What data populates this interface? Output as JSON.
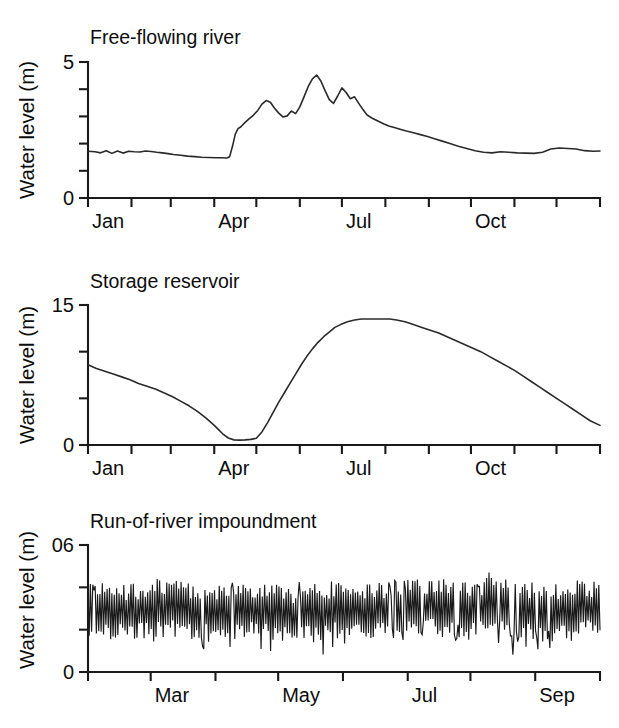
{
  "figure": {
    "axis_title": "Water level (m)",
    "line_color": "#2a2a2a",
    "axis_color": "#1a1a1a",
    "background": "#ffffff"
  },
  "panels": [
    {
      "id": "free-flowing-river",
      "title": "Free-flowing river",
      "ylabel": "Water level (m)",
      "y_top_label": "5",
      "y_bottom_label": "0",
      "x_labels": [
        "Jan",
        "Apr",
        "Jul",
        "Oct"
      ]
    },
    {
      "id": "storage-reservoir",
      "title": "Storage reservoir",
      "ylabel": "Water level (m)",
      "y_top_label": "15",
      "y_bottom_label": "0",
      "x_labels": [
        "Jan",
        "Apr",
        "Jul",
        "Oct"
      ]
    },
    {
      "id": "run-of-river-impoundment",
      "title": "Run-of-river impoundment",
      "ylabel": "Water level (m)",
      "y_top_label": "06",
      "y_bottom_label": "0",
      "x_labels": [
        "Mar",
        "May",
        "Jul",
        "Sep"
      ]
    }
  ],
  "chart_data": [
    {
      "type": "line",
      "title": "Free-flowing river",
      "xlabel": "",
      "ylabel": "Water level (m)",
      "ylim": [
        0,
        5
      ],
      "yticks": [
        0,
        1,
        2,
        3,
        4,
        5
      ],
      "ytick_labels": [
        "0",
        "",
        "",
        "",
        "",
        "5"
      ],
      "grid": false,
      "legend": "none",
      "xlim": [
        0,
        365
      ],
      "xtick_days": [
        0,
        31,
        59,
        90,
        120,
        151,
        181,
        212,
        243,
        273,
        304,
        334,
        365
      ],
      "xtick_labels": [
        "Jan",
        "",
        "",
        "Apr",
        "",
        "",
        "Jul",
        "",
        "",
        "Oct",
        "",
        "",
        ""
      ],
      "x": [
        0,
        5,
        9,
        13,
        17,
        21,
        25,
        29,
        33,
        37,
        41,
        45,
        49,
        53,
        57,
        61,
        66,
        71,
        76,
        81,
        86,
        91,
        95,
        99,
        101,
        103,
        105,
        107,
        109,
        112,
        115,
        118,
        121,
        124,
        127,
        130,
        133,
        136,
        139,
        142,
        145,
        148,
        151,
        154,
        157,
        160,
        163,
        166,
        169,
        172,
        175,
        178,
        181,
        184,
        187,
        190,
        193,
        196,
        199,
        203,
        207,
        211,
        215,
        219,
        223,
        227,
        232,
        237,
        242,
        247,
        252,
        258,
        264,
        270,
        276,
        282,
        288,
        294,
        300,
        306,
        312,
        318,
        324,
        330,
        336,
        342,
        348,
        354,
        360,
        365
      ],
      "y": [
        1.72,
        1.7,
        1.66,
        1.74,
        1.64,
        1.73,
        1.65,
        1.72,
        1.7,
        1.69,
        1.73,
        1.71,
        1.68,
        1.66,
        1.63,
        1.6,
        1.57,
        1.54,
        1.52,
        1.5,
        1.49,
        1.48,
        1.48,
        1.47,
        1.52,
        1.9,
        2.35,
        2.55,
        2.62,
        2.78,
        2.92,
        3.05,
        3.22,
        3.45,
        3.58,
        3.52,
        3.3,
        3.12,
        2.98,
        3.02,
        3.2,
        3.1,
        3.35,
        3.72,
        4.1,
        4.38,
        4.52,
        4.3,
        3.95,
        3.62,
        3.48,
        3.75,
        4.05,
        3.88,
        3.65,
        3.72,
        3.48,
        3.25,
        3.05,
        2.92,
        2.82,
        2.72,
        2.64,
        2.58,
        2.52,
        2.46,
        2.4,
        2.33,
        2.26,
        2.18,
        2.1,
        2.0,
        1.9,
        1.82,
        1.74,
        1.68,
        1.66,
        1.7,
        1.68,
        1.66,
        1.65,
        1.64,
        1.68,
        1.8,
        1.84,
        1.82,
        1.8,
        1.74,
        1.72,
        1.73
      ]
    },
    {
      "type": "line",
      "title": "Storage reservoir",
      "xlabel": "",
      "ylabel": "Water level (m)",
      "ylim": [
        0,
        15
      ],
      "yticks": [
        0,
        5,
        10,
        15
      ],
      "ytick_labels": [
        "0",
        "",
        "",
        "15"
      ],
      "grid": false,
      "legend": "none",
      "xlim": [
        0,
        365
      ],
      "xtick_days": [
        0,
        31,
        59,
        90,
        120,
        151,
        181,
        212,
        243,
        273,
        304,
        334,
        365
      ],
      "xtick_labels": [
        "Jan",
        "",
        "",
        "Apr",
        "",
        "",
        "Jul",
        "",
        "",
        "Oct",
        "",
        "",
        ""
      ],
      "x": [
        0,
        6,
        12,
        18,
        24,
        30,
        36,
        42,
        48,
        54,
        60,
        66,
        72,
        78,
        84,
        90,
        96,
        100,
        104,
        108,
        112,
        116,
        120,
        124,
        128,
        132,
        136,
        140,
        144,
        148,
        152,
        156,
        160,
        164,
        168,
        172,
        176,
        180,
        185,
        190,
        195,
        200,
        205,
        210,
        215,
        220,
        226,
        232,
        238,
        244,
        250,
        256,
        262,
        268,
        274,
        280,
        286,
        292,
        298,
        304,
        310,
        316,
        322,
        328,
        334,
        340,
        346,
        352,
        358,
        365
      ],
      "y": [
        8.6,
        8.2,
        7.9,
        7.6,
        7.3,
        7.0,
        6.6,
        6.3,
        6.0,
        5.6,
        5.2,
        4.7,
        4.2,
        3.6,
        2.9,
        2.1,
        1.2,
        0.75,
        0.55,
        0.52,
        0.55,
        0.6,
        0.72,
        1.4,
        2.4,
        3.5,
        4.6,
        5.6,
        6.6,
        7.6,
        8.6,
        9.5,
        10.3,
        11.0,
        11.6,
        12.1,
        12.6,
        12.9,
        13.2,
        13.4,
        13.5,
        13.5,
        13.5,
        13.5,
        13.5,
        13.4,
        13.2,
        12.9,
        12.6,
        12.3,
        12.0,
        11.6,
        11.2,
        10.8,
        10.4,
        10.0,
        9.5,
        9.0,
        8.5,
        8.0,
        7.4,
        6.8,
        6.2,
        5.6,
        5.0,
        4.4,
        3.8,
        3.2,
        2.6,
        2.1
      ]
    },
    {
      "type": "line",
      "title": "Run-of-river impoundment",
      "xlabel": "",
      "ylabel": "Water level (m)",
      "ylim": [
        0,
        0.6
      ],
      "yticks": [
        0,
        0.2,
        0.4,
        0.6
      ],
      "ytick_labels": [
        "0",
        "",
        "",
        "06"
      ],
      "grid": false,
      "legend": "none",
      "description": "Daily hydropeaking oscillation; values fluctuate rapidly between roughly 0.08 and 0.47 m with a mean near 0.28 m.",
      "xlim": [
        0,
        245
      ],
      "xtick_days": [
        0,
        30,
        61,
        91,
        122,
        153,
        183,
        214,
        245
      ],
      "xtick_labels": [
        "",
        "Mar",
        "",
        "May",
        "",
        "Jul",
        "",
        "Sep",
        ""
      ],
      "envelope": {
        "min": 0.08,
        "max": 0.47,
        "mean": 0.28,
        "n_points": 430,
        "seed": 20240617
      }
    }
  ]
}
